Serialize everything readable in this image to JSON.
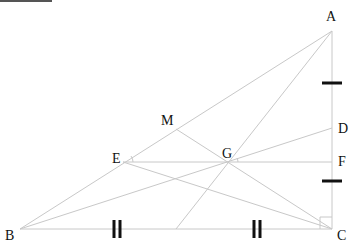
{
  "figure": {
    "type": "geometry-diagram",
    "line_color": "#c8c8c8",
    "tick_color": "#111111",
    "points": {
      "A": {
        "label": "A",
        "x": 332,
        "y": 31
      },
      "B": {
        "label": "B",
        "x": 20,
        "y": 229
      },
      "C": {
        "label": "C",
        "x": 332,
        "y": 229
      },
      "D": {
        "label": "D",
        "x": 332,
        "y": 128
      },
      "E": {
        "label": "E",
        "x": 123,
        "y": 162
      },
      "F": {
        "label": "F",
        "x": 332,
        "y": 162
      },
      "G": {
        "label": "G",
        "x": 228,
        "y": 162
      },
      "M": {
        "label": "M",
        "x": 176,
        "y": 129
      },
      "N": {
        "label": "",
        "x": 176,
        "y": 229
      }
    },
    "segments": [
      [
        "A",
        "B"
      ],
      [
        "A",
        "C"
      ],
      [
        "B",
        "C"
      ],
      [
        "A",
        "N"
      ],
      [
        "B",
        "D"
      ],
      [
        "C",
        "E"
      ],
      [
        "C",
        "M"
      ],
      [
        "E",
        "F"
      ]
    ],
    "tick_marks": {
      "BC": "double (equal halves BN = NC)",
      "AC": "single (equal segments AD-region and FC-region)"
    },
    "angle_marks": [
      "angle at E between EM and EF",
      "angle at G between GD and GF"
    ],
    "right_angle": "C"
  }
}
